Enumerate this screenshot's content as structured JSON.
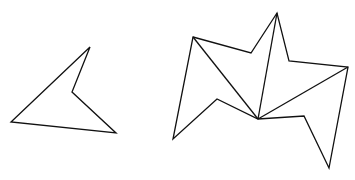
{
  "canvas": {
    "width": 355,
    "height": 180,
    "background": "#ffffff",
    "stroke": "#111111"
  },
  "shapes": [
    {
      "id": "left-polygon",
      "points": [
        [
          90,
          47
        ],
        [
          72,
          92
        ],
        [
          116,
          133
        ],
        [
          11,
          122
        ]
      ]
    },
    {
      "id": "right-polygon",
      "points": [
        [
          193,
          37
        ],
        [
          251,
          53
        ],
        [
          277,
          13
        ],
        [
          289,
          61
        ],
        [
          348,
          67
        ],
        [
          329,
          168
        ],
        [
          304,
          116
        ],
        [
          258,
          119
        ],
        [
          217,
          99
        ],
        [
          173,
          139
        ]
      ]
    }
  ],
  "diagonals": [
    {
      "from": [
        193,
        37
      ],
      "to": [
        258,
        119
      ]
    },
    {
      "from": [
        277,
        13
      ],
      "to": [
        258,
        119
      ]
    },
    {
      "from": [
        348,
        67
      ],
      "to": [
        258,
        119
      ]
    }
  ]
}
